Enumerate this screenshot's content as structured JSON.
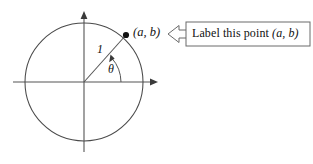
{
  "figure": {
    "name": "unit-circle-with-callout",
    "background_color": "#ffffff",
    "stroke_color": "#555555",
    "text_color": "#111111"
  },
  "axes": {
    "x_axis_name": "horizontal-axis",
    "y_axis_name": "vertical-axis",
    "origin": {
      "x": 84,
      "y": 82
    },
    "x_range_px": [
      13,
      158
    ],
    "y_range_px": [
      12,
      152
    ],
    "arrowheads": [
      "right",
      "up"
    ]
  },
  "circle": {
    "center": {
      "x": 84,
      "y": 82
    },
    "radius_px": 59,
    "label": ""
  },
  "radius": {
    "label": "1",
    "angle_degrees": 38,
    "from": {
      "x": 84,
      "y": 82
    },
    "to": {
      "x": 126,
      "y": 35
    }
  },
  "angle": {
    "label": "θ",
    "arc_radius_px": 37,
    "sweep_degrees": 38,
    "direction": "counterclockwise"
  },
  "point": {
    "dot_name": "point-marker",
    "label": "(a, b)",
    "position": {
      "x": 126,
      "y": 35
    }
  },
  "callout": {
    "text_plain": "Label this point",
    "text_math": "(a, b)",
    "arrow_direction": "left",
    "box_rect": {
      "x": 186,
      "y": 22,
      "width": 124,
      "height": 24
    }
  }
}
